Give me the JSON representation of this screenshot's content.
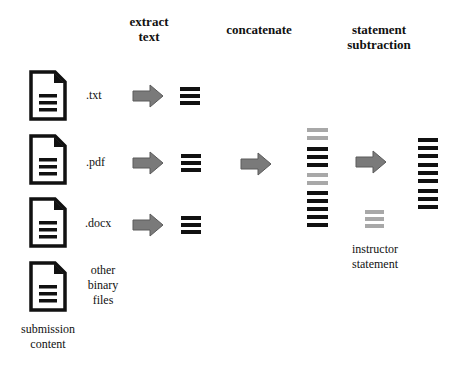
{
  "headings": {
    "extract_line1": "extract",
    "extract_line2": "text",
    "concatenate": "concatenate",
    "subtraction_line1": "statement",
    "subtraction_line2": "subtraction"
  },
  "files": [
    {
      "label": ".txt",
      "icon": "document-icon",
      "extracted": true
    },
    {
      "label": ".pdf",
      "icon": "document-icon",
      "extracted": true
    },
    {
      "label": ".docx",
      "icon": "document-icon",
      "extracted": true
    },
    {
      "label_lines": [
        "other",
        "binary",
        "files"
      ],
      "icon": "document-icon",
      "extracted": false
    }
  ],
  "submission_label": {
    "line1": "submission",
    "line2": "content"
  },
  "instructor_label": {
    "line1": "instructor",
    "line2": "statement"
  },
  "concatenated_stack": {
    "lines": [
      "gray",
      "gray",
      "black",
      "black",
      "black",
      "gray",
      "gray",
      "black",
      "black",
      "black",
      "black",
      "black"
    ]
  },
  "instructor_stack": {
    "lines": [
      "gray",
      "gray",
      "gray"
    ]
  },
  "output_stack": {
    "lines": [
      "black",
      "black",
      "black",
      "black",
      "black",
      "black",
      "black",
      "black",
      "black"
    ]
  },
  "colors": {
    "arrow_fill": "#7a7a7a",
    "arrow_stroke": "#5a5a5a",
    "line_black": "#111111",
    "line_gray": "#a8a8a8",
    "icon_stroke": "#111111"
  }
}
